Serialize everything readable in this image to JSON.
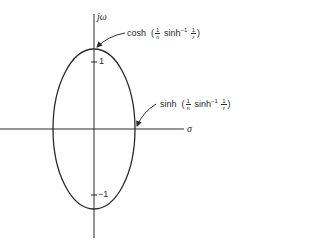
{
  "diagram": {
    "vertical_axis_label": "jω",
    "horizontal_axis_label": "σ",
    "tick_upper": "1",
    "tick_lower": "−1",
    "annotation_top": {
      "func": "cosh",
      "open": "(",
      "frac1_num": "1",
      "frac1_den": "n",
      "inner_func": "sinh",
      "inner_sup": "−1",
      "frac2_num": "1",
      "frac2_den": "ε",
      "close": ")"
    },
    "annotation_right": {
      "func": "sinh",
      "open": "(",
      "frac1_num": "1",
      "frac1_den": "n",
      "inner_func": "sinh",
      "inner_sup": "−1",
      "frac2_num": "1",
      "frac2_den": "ε",
      "close": ")"
    },
    "stroke_color": "#2a2a2a"
  }
}
